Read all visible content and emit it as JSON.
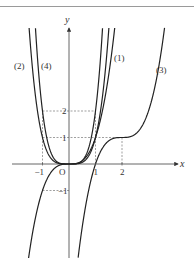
{
  "diagram": {
    "type": "function-graphs",
    "axes": {
      "x_label": "x",
      "y_label": "y",
      "origin_label": "O",
      "x_ticks": [
        {
          "value": -1,
          "label": "−1"
        },
        {
          "value": 1,
          "label": "1"
        },
        {
          "value": 2,
          "label": "2"
        }
      ],
      "y_ticks": [
        {
          "value": 2,
          "label": "2"
        },
        {
          "value": 1,
          "label": "1"
        },
        {
          "value": -1,
          "label": "−1"
        }
      ]
    },
    "curves": [
      {
        "id": "quartic",
        "expr": "y = x^4"
      },
      {
        "id": "double-quartic",
        "expr": "y = 2x^4"
      },
      {
        "id": "cubic",
        "expr": "y = x^3"
      },
      {
        "id": "shifted-cubic",
        "expr": "y = (x-2)^3 + 1"
      }
    ],
    "curve_labels": [
      {
        "text": "(2)",
        "x": 21,
        "y": 69
      },
      {
        "text": "(4)",
        "x": 48,
        "y": 69
      },
      {
        "text": "(1)",
        "x": 121,
        "y": 61
      },
      {
        "text": "(3)",
        "x": 163,
        "y": 73
      }
    ],
    "guide_lines": [
      {
        "from": [
          -1,
          0
        ],
        "to": [
          -1,
          2
        ],
        "note": "vertical dashed at x=-1"
      },
      {
        "from": [
          1,
          0
        ],
        "to": [
          1,
          2
        ],
        "note": "vertical dashed at x=1"
      },
      {
        "from": [
          2,
          0
        ],
        "to": [
          2,
          1
        ],
        "note": "vertical dashed at x=2"
      },
      {
        "from": [
          -1,
          2
        ],
        "to": [
          1,
          2
        ],
        "note": "horizontal dashed at y=2"
      },
      {
        "from": [
          -1,
          1
        ],
        "to": [
          2,
          1
        ],
        "note": "horizontal dashed at y=1"
      },
      {
        "from": [
          -1,
          -1
        ],
        "to": [
          0,
          -1
        ],
        "note": "horizontal dashed at y=-1"
      }
    ]
  }
}
